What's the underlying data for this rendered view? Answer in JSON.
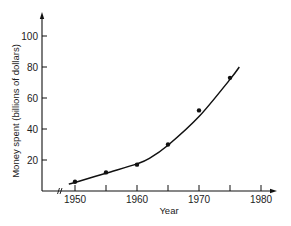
{
  "chart_data": {
    "type": "line",
    "title": "",
    "xlabel": "Year",
    "ylabel": "Money spent (billions of dollars)",
    "x_ticks": [
      1950,
      1960,
      1970,
      1980
    ],
    "x_minor_ticks": [
      1955,
      1965,
      1975
    ],
    "y_ticks": [
      20,
      40,
      60,
      80,
      100
    ],
    "xlim": [
      1945,
      1982
    ],
    "ylim": [
      0,
      114
    ],
    "grid": false,
    "legend": null,
    "axis_break_on_x": true,
    "series": [
      {
        "name": "Observed",
        "style": "scatter",
        "x": [
          1950,
          1955,
          1960,
          1965,
          1970,
          1975
        ],
        "values": [
          6,
          12,
          17,
          30,
          52,
          73
        ]
      },
      {
        "name": "Fitted curve",
        "style": "smooth-line",
        "x": [
          1949,
          1950,
          1955,
          1960,
          1962,
          1965,
          1970,
          1975,
          1976.5
        ],
        "values": [
          4.5,
          5.5,
          11.5,
          17.5,
          21,
          29.5,
          48,
          72,
          80
        ]
      }
    ]
  },
  "colors": {
    "ink": "#111111",
    "background": "#ffffff"
  }
}
